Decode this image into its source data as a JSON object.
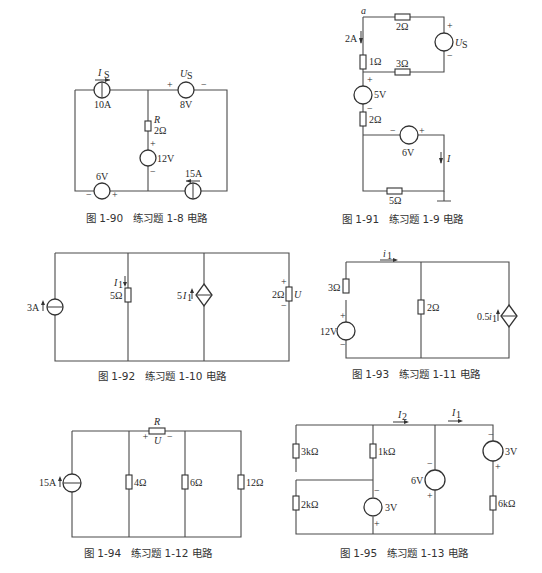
{
  "figures": [
    {
      "id": "fig-1-90",
      "caption": "图 1-90　练习题 1-8 电路",
      "labels": {
        "is_name": "I",
        "is_sub": "S",
        "is_value": "10A",
        "us_name": "U",
        "us_sub": "S",
        "us_value": "8V",
        "us_plus": "+",
        "us_minus": "−",
        "r_name": "R",
        "r_value": "2Ω",
        "v12_value": "12V",
        "v12_plus": "+",
        "v12_minus": "−",
        "v6_value": "6V",
        "v6_minus": "−",
        "v6_plus": "+",
        "i15_value": "15A"
      }
    },
    {
      "id": "fig-1-91",
      "caption": "图 1-91　练习题 1-9 电路",
      "labels": {
        "node_a": "a",
        "i2a": "2A",
        "r_top": "2Ω",
        "us_name": "U",
        "us_sub": "S",
        "us_plus": "+",
        "us_minus": "−",
        "r1": "1Ω",
        "r3": "3Ω",
        "v5_value": "5V",
        "v5_plus": "+",
        "v5_minus": "−",
        "r2": "2Ω",
        "v6_value": "6V",
        "v6_minus": "−",
        "v6_plus": "+",
        "i_name": "I",
        "r5": "5Ω"
      }
    },
    {
      "id": "fig-1-92",
      "caption": "图 1-92　练习题 1-10 电路",
      "labels": {
        "is_value": "3A",
        "i1_name": "I",
        "i1_sub": "1",
        "r5": "5Ω",
        "dep_coef": "5",
        "dep_name": "I",
        "dep_sub": "1",
        "r2": "2Ω",
        "u_name": "U",
        "u_plus": "+",
        "u_minus": "−"
      }
    },
    {
      "id": "fig-1-93",
      "caption": "图 1-93　练习题 1-11 电路",
      "labels": {
        "i1_name": "i",
        "i1_sub": "1",
        "r3": "3Ω",
        "v12_value": "12V",
        "v12_plus": "+",
        "v12_minus": "−",
        "r2": "2Ω",
        "dep_coef": "0.5",
        "dep_name": "i",
        "dep_sub": "1"
      }
    },
    {
      "id": "fig-1-94",
      "caption": "图 1-94　练习题 1-12 电路",
      "labels": {
        "is_value": "15A",
        "r_name": "R",
        "u_name": "U",
        "u_plus": "+",
        "u_minus": "−",
        "r4": "4Ω",
        "r6": "6Ω",
        "r12": "12Ω"
      }
    },
    {
      "id": "fig-1-95",
      "caption": "图 1-95　练习题 1-13 电路",
      "labels": {
        "i2_name": "I",
        "i2_sub": "2",
        "i1_name": "I",
        "i1_sub": "1",
        "r3k": "3kΩ",
        "r1k": "1kΩ",
        "r2k": "2kΩ",
        "r6k": "6kΩ",
        "v3a_value": "3V",
        "v3a_minus": "−",
        "v3a_plus": "+",
        "v6_value": "6V",
        "v6_minus": "−",
        "v6_plus": "+",
        "v3b_value": "3V",
        "v3b_minus": "−",
        "v3b_plus": "+"
      }
    }
  ]
}
